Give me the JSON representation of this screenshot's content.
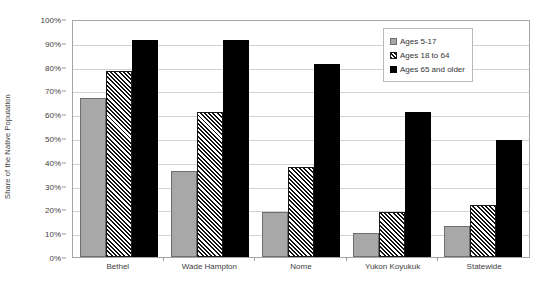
{
  "chart_data": {
    "type": "bar",
    "title": "",
    "xlabel": "",
    "ylabel": "Share of the Native Population",
    "ylim": [
      0,
      100
    ],
    "ytick_labels": [
      "100%",
      "90%",
      "80%",
      "70%",
      "60%",
      "50%",
      "40%",
      "30%",
      "20%",
      "10%",
      "0%"
    ],
    "ytick_values": [
      100,
      90,
      80,
      70,
      60,
      50,
      40,
      30,
      20,
      10,
      0
    ],
    "grid": true,
    "legend_position": "top-right",
    "categories": [
      "Bethel",
      "Wade Hampton",
      "Nome",
      "Yukon Koyukuk",
      "Statewide"
    ],
    "series": [
      {
        "name": "Ages 5-17",
        "values": [
          67,
          36,
          19,
          10,
          13
        ]
      },
      {
        "name": "Ages 18 to 64",
        "values": [
          78,
          61,
          38,
          19,
          22
        ]
      },
      {
        "name": "Ages 65 and older",
        "values": [
          91,
          91,
          81,
          61,
          49
        ]
      }
    ]
  },
  "colors": {
    "series_0": "#a8a8a8",
    "series_1": "#ffffff",
    "series_2": "#000000",
    "gridline": "#d2d2d2",
    "axis": "#a6a6a6",
    "text": "#404040",
    "background": "#ffffff"
  }
}
